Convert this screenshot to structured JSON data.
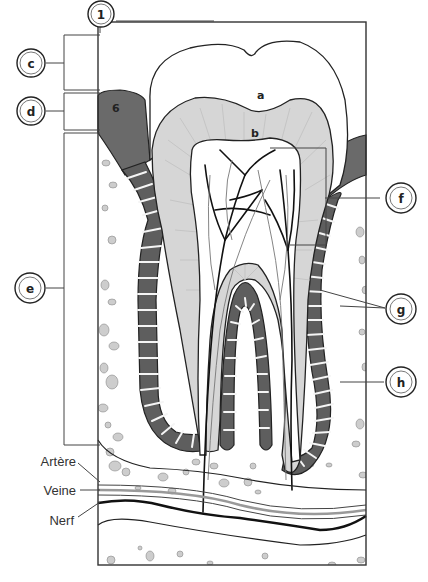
{
  "diagram": {
    "colors": {
      "enamel": "#ffffff",
      "dentin": "#d4d4d4",
      "pulp": "#ffffff",
      "gum": "#6a6a6a",
      "ligament": "#5e5e5e",
      "bone_bg": "#ffffff",
      "bone_spots": "#cfcfcf",
      "outline": "#222222",
      "nerve": "#111111"
    },
    "callouts": [
      {
        "id": "1",
        "label": "1"
      },
      {
        "id": "c",
        "label": "c"
      },
      {
        "id": "d",
        "label": "d"
      },
      {
        "id": "e",
        "label": "e"
      },
      {
        "id": "f",
        "label": "f"
      },
      {
        "id": "g",
        "label": "g"
      },
      {
        "id": "h",
        "label": "h"
      }
    ],
    "inner_labels": [
      {
        "id": "a",
        "label": "a"
      },
      {
        "id": "b",
        "label": "b"
      },
      {
        "id": "6",
        "label": "6"
      }
    ],
    "vessel_labels": [
      {
        "id": "artere",
        "label": "Artère"
      },
      {
        "id": "veine",
        "label": "Veine"
      },
      {
        "id": "nerf",
        "label": "Nerf"
      }
    ]
  }
}
